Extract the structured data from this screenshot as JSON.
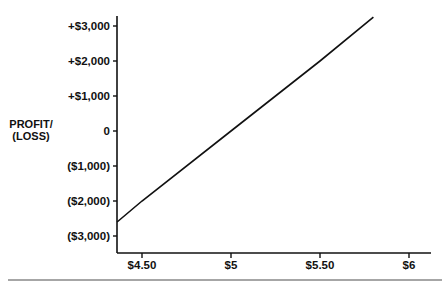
{
  "chart_data": {
    "type": "line",
    "title": "",
    "xlabel": "",
    "ylabel": "PROFIT/ (LOSS)",
    "ylabel_lines": [
      "PROFIT/",
      "(LOSS)"
    ],
    "x_ticks": [
      {
        "value": 4.5,
        "label": "$4.50"
      },
      {
        "value": 5.0,
        "label": "$5"
      },
      {
        "value": 5.5,
        "label": "$5.50"
      },
      {
        "value": 6.0,
        "label": "$6"
      }
    ],
    "y_ticks": [
      {
        "value": 3000,
        "label": "+$3,000"
      },
      {
        "value": 2000,
        "label": "+$2,000"
      },
      {
        "value": 1000,
        "label": "+$1,000"
      },
      {
        "value": 0,
        "label": "0"
      },
      {
        "value": -1000,
        "label": "($1,000)"
      },
      {
        "value": -2000,
        "label": "($2,000)"
      },
      {
        "value": -3000,
        "label": "($3,000)"
      }
    ],
    "xlim": [
      4.36,
      6.12
    ],
    "ylim": [
      -3500,
      3300
    ],
    "series": [
      {
        "name": "Profit/Loss",
        "x": [
          4.36,
          4.5,
          5.0,
          5.5,
          5.8
        ],
        "y": [
          -2600,
          -2000,
          0,
          2000,
          3250
        ]
      }
    ],
    "grid": false,
    "legend": null
  }
}
